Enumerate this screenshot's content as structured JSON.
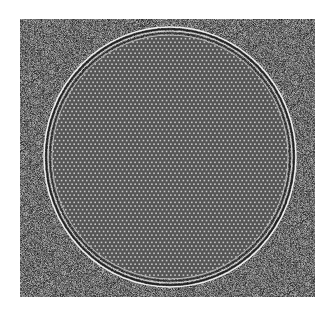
{
  "image": {
    "description": "Grayscale micrograph of a circular region filled with a fine periodic hexagonal lattice of bright dots, surrounded by concentric fringe rings, on a noisy gray background",
    "background_color": "#ffffff",
    "field": {
      "x": 20,
      "y": 19,
      "width": 295,
      "height": 278,
      "mean_gray": "#6e6e6e"
    },
    "disk": {
      "cx": 170,
      "cy": 157,
      "rx": 126,
      "ry": 130,
      "fill_gray": "#555555",
      "lattice_period_px": 4.2,
      "lattice_dot_color": "#c8c8c8"
    },
    "rings": [
      {
        "offset": 0,
        "color": "#f0f0f0",
        "width": 1.5
      },
      {
        "offset": -2,
        "color": "#1e1e1e",
        "width": 1.5
      },
      {
        "offset": -4,
        "color": "#dcdcdc",
        "width": 1
      },
      {
        "offset": -6,
        "color": "#2a2a2a",
        "width": 1.2
      },
      {
        "offset": -8,
        "color": "#bbbbbb",
        "width": 1
      }
    ]
  }
}
